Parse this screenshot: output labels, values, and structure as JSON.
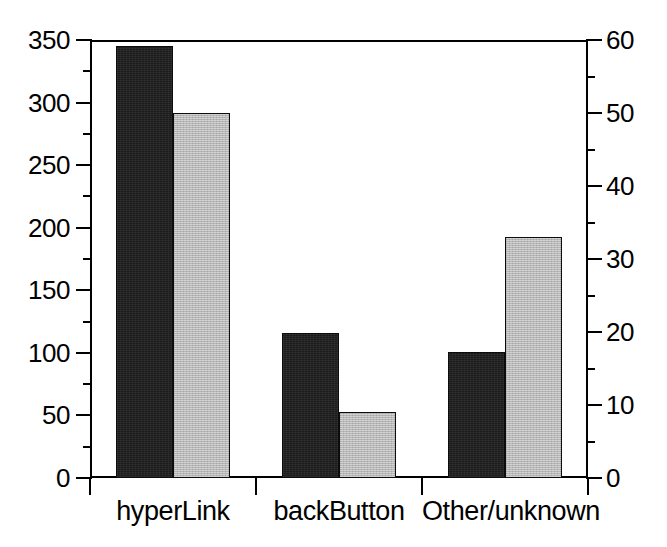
{
  "chart_data": {
    "type": "bar",
    "title": "",
    "subtitle": "",
    "xlabel": "",
    "ylabel": "",
    "grid": false,
    "legend": null,
    "categories": [
      "hyperLink",
      "backButton",
      "Other/unknown"
    ],
    "series": [
      {
        "name": "series-1-dark",
        "axis": "left",
        "color": "#1b1b1b",
        "values": [
          345,
          116,
          101
        ]
      },
      {
        "name": "series-2-light",
        "axis": "right",
        "color": "#b7b7b7",
        "values": [
          50,
          9,
          33
        ]
      }
    ],
    "axes": {
      "left": {
        "ylim": [
          0,
          350
        ],
        "ticks": [
          0,
          50,
          100,
          150,
          200,
          250,
          300,
          350
        ],
        "tick_labels": [
          "0",
          "50",
          "100",
          "150",
          "200",
          "250",
          "300",
          "350"
        ],
        "minor_ticks": [
          25,
          75,
          125,
          175,
          225,
          275,
          325
        ]
      },
      "right": {
        "ylim": [
          0,
          60
        ],
        "ticks": [
          0,
          10,
          20,
          30,
          40,
          50,
          60
        ],
        "tick_labels": [
          "0",
          "10",
          "20",
          "30",
          "40",
          "50",
          "60"
        ],
        "minor_ticks": [
          5,
          15,
          25,
          35,
          45,
          55
        ]
      }
    }
  },
  "colors": {
    "background": "#ffffff",
    "axis": "#000000",
    "series_dark": "#1b1b1b",
    "series_light": "#b7b7b7"
  }
}
